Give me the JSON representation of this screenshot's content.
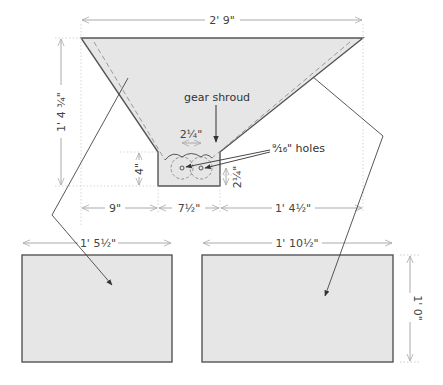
{
  "diagram": {
    "overall_width": "2' 9\"",
    "overall_height": "1' 4 3/4\"",
    "collar_height": "4\"",
    "hole_spacing": "2 1/4\"",
    "hole_height": "2 1/4\"",
    "bottom_left": "9\"",
    "bottom_mid": "7 1/2\"",
    "bottom_right": "1' 4 1/2\"",
    "panel_left_width": "1' 5 1/2\"",
    "panel_right_width": "1' 10 1/2\"",
    "panel_right_height": "1' 0\"",
    "label_gear_shroud": "gear shroud",
    "label_holes": "9/16\" holes"
  },
  "display": {
    "overall_width": "2' 9\"",
    "overall_height": "1' 4 ¾\"",
    "collar_height": "4\"",
    "hole_spacing": "2¼\"",
    "hole_height": "2¼\"",
    "bottom_left": "9\"",
    "bottom_mid": "7½\"",
    "bottom_right": "1' 4½\"",
    "panel_left_width": "1' 5½\"",
    "panel_right_width": "1' 10½\"",
    "panel_right_height": "1' 0\"",
    "label_gear_shroud": "gear shroud",
    "label_holes": "⁹⁄₁₆\" holes"
  },
  "colors": {
    "fill": "#e6e6e6",
    "outline": "#555555",
    "dim_line": "#aaaaaa",
    "dashed": "#999999",
    "leader": "#444444"
  }
}
